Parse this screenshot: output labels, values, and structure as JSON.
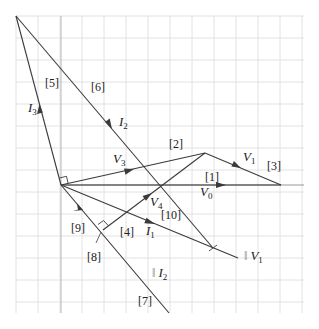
{
  "diagram": {
    "type": "phasor-diagram",
    "grid": {
      "x0": 16,
      "y0": 16,
      "x1": 304,
      "y1": 313,
      "spacing": 22
    },
    "origin": {
      "x": 61,
      "y": 185
    },
    "colors": {
      "line": "#3a3a3a",
      "grid": "#e2e2e2",
      "axis": "#b8b8b8"
    },
    "vectors": {
      "V0": {
        "name": "V",
        "sub": "0"
      },
      "V1": {
        "name": "V",
        "sub": "1"
      },
      "V3": {
        "name": "V",
        "sub": "3"
      },
      "V4": {
        "name": "V",
        "sub": "4"
      },
      "I1": {
        "name": "I",
        "sub": "1"
      },
      "I2": {
        "name": "I",
        "sub": "2"
      },
      "I3": {
        "name": "I",
        "sub": "3"
      }
    },
    "parallel_labels": {
      "par_V1": {
        "prefix": "‖ ",
        "name": "V",
        "sub": "1"
      },
      "par_I2": {
        "prefix": "‖ ",
        "name": "I",
        "sub": "2"
      }
    },
    "markers": [
      "[1]",
      "[2]",
      "[3]",
      "[4]",
      "[5]",
      "[6]",
      "[7]",
      "[8]",
      "[9]",
      "[10]"
    ]
  }
}
